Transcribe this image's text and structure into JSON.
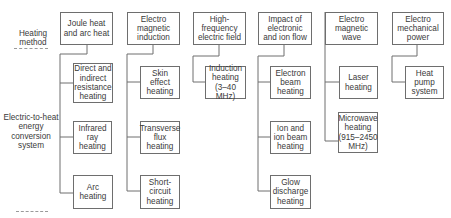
{
  "diagram": {
    "left_labels": {
      "heating_method": "Heating method",
      "root": "Electric-to-heat energy conversion system"
    },
    "columns": [
      {
        "title": "Joule heat and arc heat",
        "children": [
          "Direct and indirect resistance heating",
          "Infrared ray heating",
          "Arc heating"
        ]
      },
      {
        "title": "Electro magnetic induction",
        "children": [
          "Skin effect heating",
          "Transverse flux heating",
          "Short-circuit heating"
        ]
      },
      {
        "title": "High-frequency electric field",
        "children": [
          "Induction heating (3–40 MHz)"
        ]
      },
      {
        "title": "Impact of electronic and ion flow",
        "children": [
          "Electron beam heating",
          "Ion and ion beam heating",
          "Glow discharge heating"
        ]
      },
      {
        "title": "Electro magnetic wave",
        "children": [
          "Laser heating",
          "Microwave heating (915–2450 MHz)"
        ]
      },
      {
        "title": "Electro mechanical power",
        "children": [
          "Heat pump system"
        ]
      }
    ],
    "colors": {
      "line": "#6e6e6e",
      "text": "#3a3a3a",
      "background": "#ffffff"
    }
  }
}
